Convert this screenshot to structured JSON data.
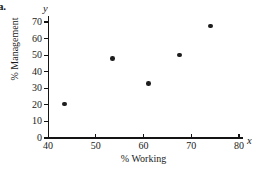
{
  "figure": {
    "part_label": "a."
  },
  "chart_data": {
    "type": "scatter",
    "title": "",
    "xlabel": "% Working",
    "ylabel": "% Management",
    "x_var_symbol": "x",
    "y_var_symbol": "y",
    "xlim": [
      40,
      80
    ],
    "ylim": [
      0,
      70
    ],
    "xticks": [
      40,
      50,
      60,
      70,
      80
    ],
    "yticks": [
      0,
      10,
      20,
      30,
      40,
      50,
      60,
      70
    ],
    "xtick_labels": [
      "40",
      "50",
      "60",
      "70",
      "80"
    ],
    "ytick_labels": [
      "0",
      "10",
      "20",
      "30",
      "40",
      "50",
      "60",
      "70"
    ],
    "grid": false,
    "legend": false,
    "marker": "filled-circle",
    "marker_color": "#1d1d1d",
    "points": [
      {
        "x": 43.5,
        "y": 20.5
      },
      {
        "x": 53.5,
        "y": 48.0
      },
      {
        "x": 61.0,
        "y": 33.0
      },
      {
        "x": 67.5,
        "y": 50.0
      },
      {
        "x": 74.0,
        "y": 67.5
      }
    ]
  }
}
